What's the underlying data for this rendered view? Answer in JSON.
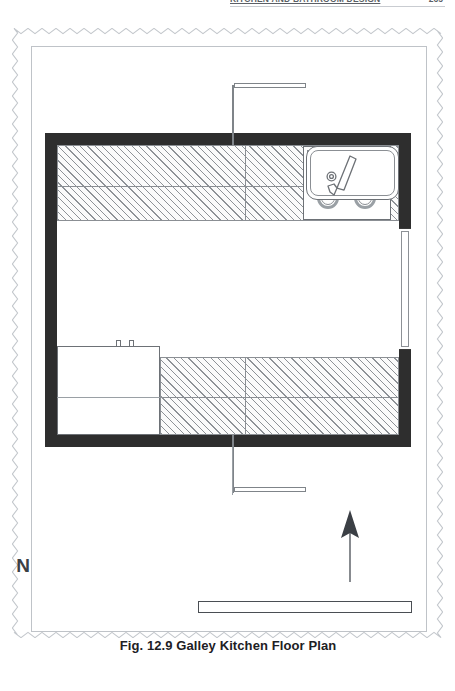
{
  "running_head": {
    "text": "KITCHEN AND BATHROOM DESIGN",
    "page_number": "265"
  },
  "figure": {
    "caption": "Fig. 12.9 Galley Kitchen Floor Plan",
    "type": "architectural-floor-plan",
    "room_name": "Galley Kitchen"
  },
  "north_arrow": {
    "label": "N",
    "direction": "up",
    "icon": "north-arrow-icon"
  },
  "scale_bar": {
    "unit": "feet",
    "tick_labels": [
      "0'",
      "1'",
      "2'",
      "3'",
      "4'",
      "5'",
      "6'"
    ],
    "segments": [
      {
        "from": "0'",
        "to": "1'",
        "fill": "subdivided"
      },
      {
        "from": "1'",
        "to": "2'",
        "fill": "light"
      },
      {
        "from": "2'",
        "to": "3'",
        "fill": "dark"
      },
      {
        "from": "3'",
        "to": "4'",
        "fill": "light"
      },
      {
        "from": "4'",
        "to": "5'",
        "fill": "dark"
      },
      {
        "from": "5'",
        "to": "6'",
        "fill": "light"
      }
    ],
    "subdivisions": 6
  },
  "plan_elements": {
    "walls": [
      {
        "name": "wall-top",
        "position": "north"
      },
      {
        "name": "wall-bottom",
        "position": "south"
      },
      {
        "name": "wall-left",
        "position": "west"
      },
      {
        "name": "wall-right",
        "position": "east"
      }
    ],
    "counters": [
      {
        "name": "counter-top",
        "label": "Upper counter run"
      },
      {
        "name": "counter-bottom",
        "label": "Lower counter run"
      }
    ],
    "fixtures": [
      {
        "name": "cooktop",
        "label": "Cooktop",
        "burners": 4
      },
      {
        "name": "sink",
        "label": "Sink",
        "basins": 1,
        "faucet": true
      },
      {
        "name": "range",
        "label": "Range",
        "knobs": 2
      }
    ],
    "openings": [
      {
        "name": "door-top",
        "label": "Door",
        "swing": "north"
      },
      {
        "name": "door-bottom",
        "label": "Door",
        "swing": "south"
      },
      {
        "name": "window-right",
        "label": "Window",
        "wall": "east"
      }
    ]
  },
  "colors": {
    "wall_fill": "#2e2e2e",
    "hatch_line": "#8e9297",
    "outline": "#6d7176",
    "scale_dark": "#4a4e53",
    "caption_text": "#1d2024"
  }
}
